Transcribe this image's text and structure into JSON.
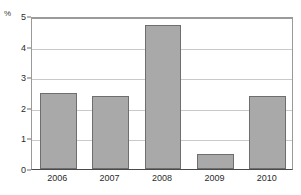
{
  "chart_data": {
    "type": "bar",
    "title": "",
    "subtitle": "",
    "xlabel": "",
    "ylabel": "%",
    "unit_label": "%",
    "categories": [
      "2006",
      "2007",
      "2008",
      "2009",
      "2010"
    ],
    "values": [
      2.5,
      2.4,
      4.7,
      0.5,
      2.4
    ],
    "series": [
      {
        "name": "",
        "values": [
          2.5,
          2.4,
          4.7,
          0.5,
          2.4
        ]
      }
    ],
    "ylim": [
      0,
      5
    ],
    "xlim": [
      0,
      5
    ],
    "y_ticks": [
      0,
      1,
      2,
      3,
      4,
      5
    ],
    "y_tick_labels": [
      "0",
      "1",
      "2",
      "3",
      "4",
      "5"
    ],
    "x_tick_labels": [
      "2006",
      "2007",
      "2008",
      "2009",
      "2010"
    ],
    "grid": true,
    "grid_axis": "y",
    "legend": false,
    "legend_position": "none",
    "annotations": [],
    "colors": {
      "bar_fill": "#a9a9a9",
      "bar_border": "#6e6e6e",
      "gridline": "#c9c9c9",
      "axis": "#4a4a4a",
      "plot_border": "#9a9a9a",
      "text": "#2b2b2b",
      "background": "#ffffff"
    }
  }
}
